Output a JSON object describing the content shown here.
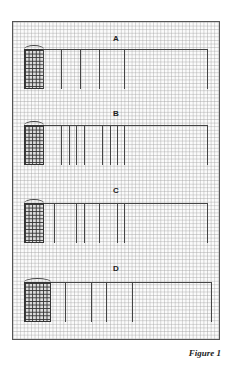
{
  "figure": {
    "caption": "Figure 1",
    "panels": [
      {
        "label": "A",
        "ticks": [
          42,
          56,
          71,
          91,
          207
        ]
      },
      {
        "label": "B",
        "ticks": [
          41,
          49,
          56,
          63,
          82,
          89,
          96,
          103,
          207
        ]
      },
      {
        "label": "C",
        "ticks": [
          35,
          56,
          63,
          79,
          96,
          103,
          207
        ]
      },
      {
        "label": "D",
        "ticks": [
          45,
          71,
          86,
          112,
          207
        ]
      }
    ]
  },
  "colors": {
    "line": "#444444",
    "grid": "#a0a0a0",
    "paper": "#fbfbfb"
  }
}
